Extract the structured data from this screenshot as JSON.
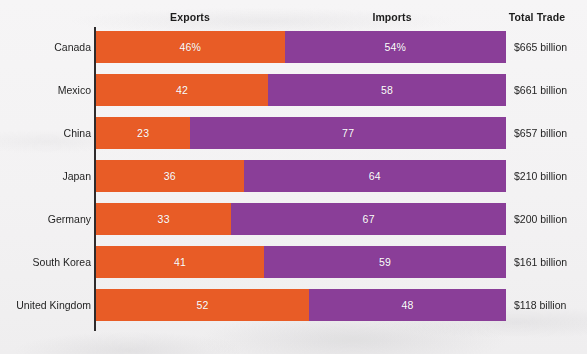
{
  "headers": {
    "exports": "Exports",
    "imports": "Imports",
    "total": "Total Trade"
  },
  "colors": {
    "exports": "#e85c26",
    "imports": "#8a3e98",
    "background": "#f3f2f3",
    "axis": "#2e2b2c",
    "label_text": "#1f1f1f",
    "bar_text": "#ffffff"
  },
  "rows": [
    {
      "label": "Canada",
      "exports_label": "46%",
      "imports_label": "54%",
      "exports_value": 46,
      "imports_value": 54,
      "total": "$665 billion"
    },
    {
      "label": "Mexico",
      "exports_label": "42",
      "imports_label": "58",
      "exports_value": 42,
      "imports_value": 58,
      "total": "$661 billion"
    },
    {
      "label": "China",
      "exports_label": "23",
      "imports_label": "77",
      "exports_value": 23,
      "imports_value": 77,
      "total": "$657 billion"
    },
    {
      "label": "Japan",
      "exports_label": "36",
      "imports_label": "64",
      "exports_value": 36,
      "imports_value": 64,
      "total": "$210 billion"
    },
    {
      "label": "Germany",
      "exports_label": "33",
      "imports_label": "67",
      "exports_value": 33,
      "imports_value": 67,
      "total": "$200 billion"
    },
    {
      "label": "South Korea",
      "exports_label": "41",
      "imports_label": "59",
      "exports_value": 41,
      "imports_value": 59,
      "total": "$161 billion"
    },
    {
      "label": "United Kingdom",
      "exports_label": "52",
      "imports_label": "48",
      "exports_value": 52,
      "imports_value": 48,
      "total": "$118 billion"
    }
  ],
  "layout": {
    "bar_left_px": 96,
    "bar_width_px": 410,
    "bar_height_px": 32,
    "row_pitch_px": 43,
    "first_row_top_px": 31
  },
  "chart_data": {
    "type": "bar",
    "orientation": "horizontal",
    "stacked": true,
    "normalized": true,
    "title": "",
    "subtitle": "",
    "xlabel": "",
    "ylabel": "",
    "xlim": [
      0,
      100
    ],
    "grid": false,
    "legend_position": "top-as-column-headers",
    "categories": [
      "Canada",
      "Mexico",
      "China",
      "Japan",
      "Germany",
      "South Korea",
      "United Kingdom"
    ],
    "series": [
      {
        "name": "Exports",
        "color": "#e85c26",
        "unit": "percent",
        "values": [
          46,
          42,
          23,
          36,
          33,
          41,
          52
        ],
        "data_labels": [
          "46%",
          "42",
          "23",
          "36",
          "33",
          "41",
          "52"
        ]
      },
      {
        "name": "Imports",
        "color": "#8a3e98",
        "unit": "percent",
        "values": [
          54,
          58,
          77,
          64,
          67,
          59,
          48
        ],
        "data_labels": [
          "54%",
          "58",
          "77",
          "64",
          "67",
          "59",
          "48"
        ]
      }
    ],
    "annotation_column": {
      "name": "Total Trade",
      "values": [
        "$665 billion",
        "$661 billion",
        "$657 billion",
        "$210 billion",
        "$200 billion",
        "$161 billion",
        "$118 billion"
      ]
    }
  }
}
